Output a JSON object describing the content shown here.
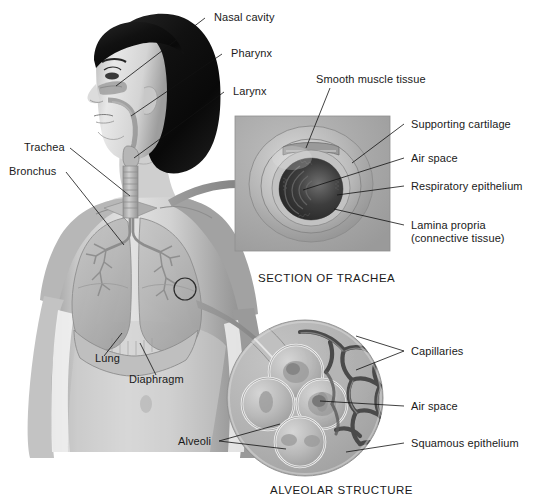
{
  "figure": {
    "background_color": "#ffffff",
    "text_color": "#1a1a1a",
    "leader_line_color": "#111111",
    "arrow_color": "#8b8b8b"
  },
  "labels": {
    "nasal_cavity": "Nasal cavity",
    "pharynx": "Pharynx",
    "larynx": "Larynx",
    "trachea": "Trachea",
    "bronchus": "Bronchus",
    "lung": "Lung",
    "diaphragm": "Diaphragm",
    "smooth_muscle_tissue": "Smooth muscle tissue",
    "supporting_cartilage": "Supporting cartilage",
    "air_space_trachea": "Air space",
    "respiratory_epithelium": "Respiratory epithelium",
    "lamina_propria_line1": "Lamina propria",
    "lamina_propria_line2": "(connective tissue)",
    "capillaries": "Capillaries",
    "air_space_alveoli": "Air space",
    "squamous_epithelium": "Squamous epithelium",
    "alveoli": "Alveoli"
  },
  "captions": {
    "section_of_trachea": "SECTION OF TRACHEA",
    "alveolar_structure": "ALVEOLAR STRUCTURE"
  },
  "panels": {
    "body": {
      "name": "anatomical body illustration",
      "structures": [
        "head",
        "hair",
        "face",
        "neck",
        "trachea",
        "bronchi",
        "lungs",
        "diaphragm",
        "torso",
        "arms"
      ]
    },
    "trachea_section": {
      "name": "SECTION OF TRACHEA",
      "shape": "square inset",
      "panel_color": "#a9a9a9",
      "structures": [
        "smooth muscle tissue",
        "supporting cartilage",
        "air space",
        "respiratory epithelium",
        "lamina propria"
      ]
    },
    "alveolar_structure": {
      "name": "ALVEOLAR STRUCTURE",
      "shape": "circular inset",
      "panel_color": "#b0b0b0",
      "structures": [
        "alveoli",
        "capillaries",
        "air space",
        "squamous epithelium",
        "bronchiole"
      ]
    }
  },
  "markers": {
    "lung_detail_circle": "circle marker on left lung indicating alveolar detail region"
  }
}
